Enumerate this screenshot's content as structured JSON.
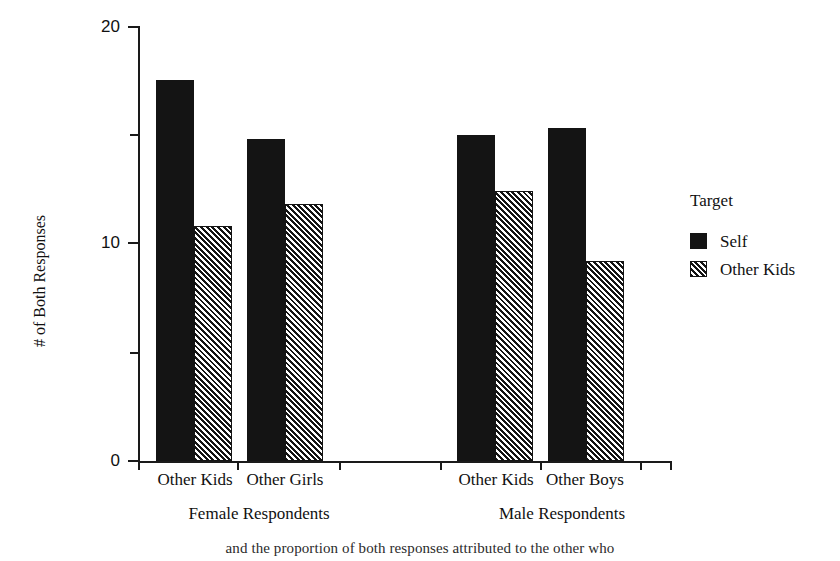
{
  "chart_data": {
    "type": "bar",
    "title": "",
    "xlabel": "",
    "ylabel": "# of Both Responses",
    "ylim": [
      0,
      20
    ],
    "yticks": [
      0,
      10,
      20
    ],
    "yticks_minor": [
      5,
      15
    ],
    "grid": false,
    "legend_position": "right",
    "legend_title": "Target",
    "categories": [
      "Other Kids",
      "Other Girls",
      "Other Kids",
      "Other Boys"
    ],
    "groups": [
      "Female Respondents",
      "Male Respondents"
    ],
    "series": [
      {
        "name": "Self",
        "fill": "solid",
        "values": [
          17.5,
          14.8,
          15.0,
          15.3
        ]
      },
      {
        "name": "Other Kids",
        "fill": "hatched",
        "values": [
          10.8,
          11.8,
          12.4,
          9.2
        ]
      }
    ]
  },
  "axis": {
    "y_title": "# of Both Responses",
    "y_tick_labels": [
      "20",
      "10",
      "0"
    ]
  },
  "x_labels": {
    "female": [
      "Other Kids",
      "Other Girls"
    ],
    "male": [
      "Other Kids",
      "Other Boys"
    ],
    "group_female": "Female Respondents",
    "group_male": "Male Respondents"
  },
  "legend": {
    "title": "Target",
    "items": [
      {
        "label": "Self",
        "pattern": "solid-black-swatch"
      },
      {
        "label": "Other Kids",
        "pattern": "hatched-swatch"
      }
    ]
  },
  "bottom_caption": "and the proportion of both responses attributed to the other who"
}
